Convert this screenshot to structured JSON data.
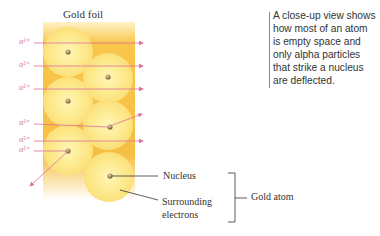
{
  "diagram": {
    "title": "Gold foil",
    "caption": "A close-up view shows how most of an atom is empty space and only alpha particles that strike a nucleus are deflected.",
    "caption_lines": [
      "A close-up view shows",
      "how most of an atom",
      "is empty space and",
      "only alpha particles",
      "that strike a nucleus",
      "are deflected."
    ],
    "alpha_label": "α²⁺",
    "labels": {
      "nucleus": "Nucleus",
      "electrons_line1": "Surrounding",
      "electrons_line2": "electrons",
      "gold_atom": "Gold atom"
    },
    "colors": {
      "foil": "#f7c94a",
      "atom": "#fbe68a",
      "alpha": "#e0709a",
      "nucleus": "#8a7040"
    }
  }
}
